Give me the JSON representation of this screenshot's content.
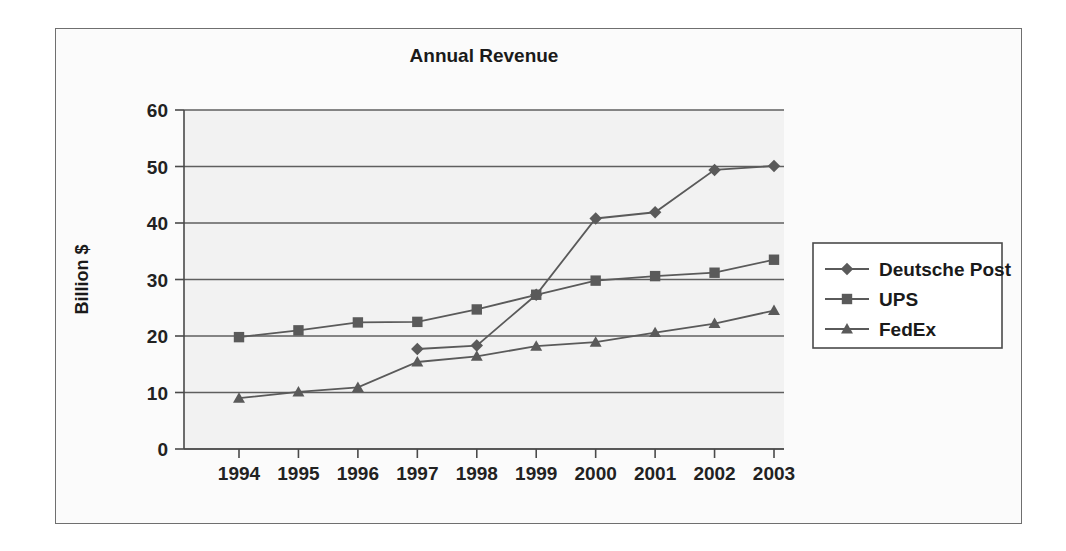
{
  "chart_data": {
    "type": "line",
    "title": "Annual Revenue",
    "xlabel": "",
    "ylabel": "Billion $",
    "categories": [
      "1994",
      "1995",
      "1996",
      "1997",
      "1998",
      "1999",
      "2000",
      "2001",
      "2002",
      "2003"
    ],
    "x": [
      1994,
      1995,
      1996,
      1997,
      1998,
      1999,
      2000,
      2001,
      2002,
      2003
    ],
    "ylim": [
      0,
      60
    ],
    "ytick_step": 10,
    "yticks": [
      "0",
      "10",
      "20",
      "30",
      "40",
      "50",
      "60"
    ],
    "grid": "horizontal",
    "legend_position": "right",
    "series": [
      {
        "name": "Deutsche Post",
        "marker": "diamond",
        "color": "#5a5a5a",
        "values": [
          null,
          null,
          null,
          17.7,
          18.3,
          27.3,
          40.8,
          41.9,
          49.4,
          50.1
        ]
      },
      {
        "name": "UPS",
        "marker": "square",
        "color": "#5a5a5a",
        "values": [
          19.8,
          21.0,
          22.4,
          22.5,
          24.7,
          27.3,
          29.8,
          30.6,
          31.2,
          33.5
        ]
      },
      {
        "name": "FedEx",
        "marker": "triangle",
        "color": "#5a5a5a",
        "values": [
          9.0,
          10.1,
          10.9,
          15.4,
          16.4,
          18.2,
          18.9,
          20.6,
          22.2,
          24.5
        ]
      }
    ]
  },
  "legend": {
    "entries": [
      {
        "label": "Deutsche Post",
        "marker": "diamond"
      },
      {
        "label": "UPS",
        "marker": "square"
      },
      {
        "label": "FedEx",
        "marker": "triangle"
      }
    ]
  },
  "colors": {
    "series": "#5a5a5a",
    "axis": "#4a4a4a",
    "grid": "#5f5f5f",
    "text": "#1a1a1a",
    "plot_background": "#f2f2f2",
    "figure_background": "#fbfbfb",
    "frame": "#6f6f6f"
  }
}
